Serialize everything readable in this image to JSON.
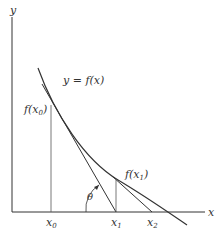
{
  "diagram": {
    "axes": {
      "x_label": "x",
      "y_label": "y"
    },
    "curve_label": "y = f(x)",
    "points": {
      "x0_label": "x",
      "x0_sub": "0",
      "x1_label": "x",
      "x1_sub": "1",
      "x2_label": "x",
      "x2_sub": "2"
    },
    "values": {
      "fx0_label_pre": "f(x",
      "fx0_sub": "0",
      "fx0_label_post": ")",
      "fx1_label_pre": "f(x",
      "fx1_sub": "1",
      "fx1_label_post": ")"
    },
    "angle_label": "θ",
    "colors": {
      "line": "#333333",
      "background": "#ffffff"
    }
  }
}
